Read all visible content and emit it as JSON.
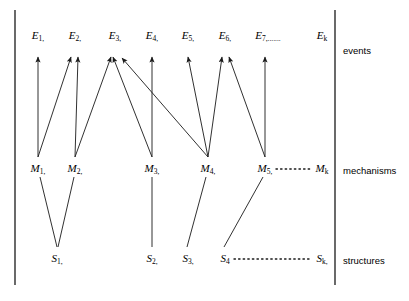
{
  "figure": {
    "ink_color": "#1a1a1a",
    "background": "#ffffff",
    "rows": [
      {
        "key": "events",
        "label": "events"
      },
      {
        "key": "mechanisms",
        "label": "mechanisms"
      },
      {
        "key": "structures",
        "label": "structures"
      }
    ],
    "events": [
      {
        "id": "E1",
        "base": "E",
        "sub": "1,",
        "x": 38
      },
      {
        "id": "E2",
        "base": "E",
        "sub": "2,",
        "x": 75
      },
      {
        "id": "E3",
        "base": "E",
        "sub": "3,",
        "x": 115
      },
      {
        "id": "E4",
        "base": "E",
        "sub": "4,",
        "x": 152
      },
      {
        "id": "E5",
        "base": "E",
        "sub": "5,",
        "x": 188
      },
      {
        "id": "E6",
        "base": "E",
        "sub": "6,",
        "x": 225
      },
      {
        "id": "E7",
        "base": "E",
        "sub": "7,.......",
        "x": 268
      },
      {
        "id": "Ek",
        "base": "E",
        "sub": "k",
        "x": 322
      }
    ],
    "mechanisms": [
      {
        "id": "M1",
        "base": "M",
        "sub": "1,",
        "x": 38
      },
      {
        "id": "M2",
        "base": "M",
        "sub": "2,",
        "x": 75
      },
      {
        "id": "M3",
        "base": "M",
        "sub": "3,",
        "x": 152
      },
      {
        "id": "M4",
        "base": "M",
        "sub": "4,",
        "x": 208
      },
      {
        "id": "M5",
        "base": "M",
        "sub": "5,",
        "x": 265
      },
      {
        "id": "Mk",
        "base": "M",
        "sub": "k",
        "x": 322
      }
    ],
    "structures": [
      {
        "id": "S1",
        "base": "S",
        "sub": "1,",
        "x": 57
      },
      {
        "id": "S2",
        "base": "S",
        "sub": "2,",
        "x": 152
      },
      {
        "id": "S3",
        "base": "S",
        "sub": "3,",
        "x": 188
      },
      {
        "id": "S4",
        "base": "S",
        "sub": "4",
        "x": 225
      },
      {
        "id": "Sk",
        "base": "S",
        "sub": "k,",
        "x": 322
      }
    ],
    "ellipses": [
      {
        "name": "mechanisms-ellipsis",
        "x1": 276,
        "x2": 312,
        "y": 169
      },
      {
        "name": "structures-ellipsis",
        "x1": 234,
        "x2": 312,
        "y": 259
      }
    ],
    "arrows": [
      {
        "from": "M1",
        "to": "E1",
        "x1": 38,
        "y1": 157,
        "x2": 38,
        "y2": 57
      },
      {
        "from": "M1",
        "to": "E2",
        "x1": 38,
        "y1": 157,
        "x2": 71,
        "y2": 57
      },
      {
        "from": "M2",
        "to": "E2",
        "x1": 75,
        "y1": 157,
        "x2": 78,
        "y2": 57
      },
      {
        "from": "M2",
        "to": "E3",
        "x1": 75,
        "y1": 157,
        "x2": 111,
        "y2": 57
      },
      {
        "from": "M3",
        "to": "E3",
        "x1": 152,
        "y1": 157,
        "x2": 113,
        "y2": 57
      },
      {
        "from": "M3",
        "to": "E4",
        "x1": 152,
        "y1": 157,
        "x2": 152,
        "y2": 57
      },
      {
        "from": "M4",
        "to": "E3",
        "x1": 208,
        "y1": 157,
        "x2": 122,
        "y2": 58
      },
      {
        "from": "M4",
        "to": "E5",
        "x1": 208,
        "y1": 157,
        "x2": 188,
        "y2": 57
      },
      {
        "from": "M4",
        "to": "E6",
        "x1": 208,
        "y1": 157,
        "x2": 222,
        "y2": 57
      },
      {
        "from": "M5",
        "to": "E6",
        "x1": 265,
        "y1": 157,
        "x2": 229,
        "y2": 57
      },
      {
        "from": "M5",
        "to": "E7",
        "x1": 265,
        "y1": 157,
        "x2": 265,
        "y2": 57
      }
    ],
    "links": [
      {
        "from": "M1",
        "to": "S1",
        "x1": 40,
        "y1": 177,
        "x2": 57,
        "y2": 247
      },
      {
        "from": "M2",
        "to": "S1",
        "x1": 74,
        "y1": 177,
        "x2": 58,
        "y2": 247
      },
      {
        "from": "M3",
        "to": "S2",
        "x1": 152,
        "y1": 177,
        "x2": 152,
        "y2": 247
      },
      {
        "from": "M4",
        "to": "S3",
        "x1": 206,
        "y1": 177,
        "x2": 187,
        "y2": 247
      },
      {
        "from": "M5",
        "to": "S4",
        "x1": 263,
        "y1": 177,
        "x2": 224,
        "y2": 247
      }
    ],
    "row_label_positions": {
      "events": 46,
      "mechanisms": 166,
      "structures": 256
    },
    "row_label_x": 343,
    "left_rule_x": 15,
    "right_rule_x": 335,
    "rule_top": 10,
    "rule_bottom": 285
  }
}
